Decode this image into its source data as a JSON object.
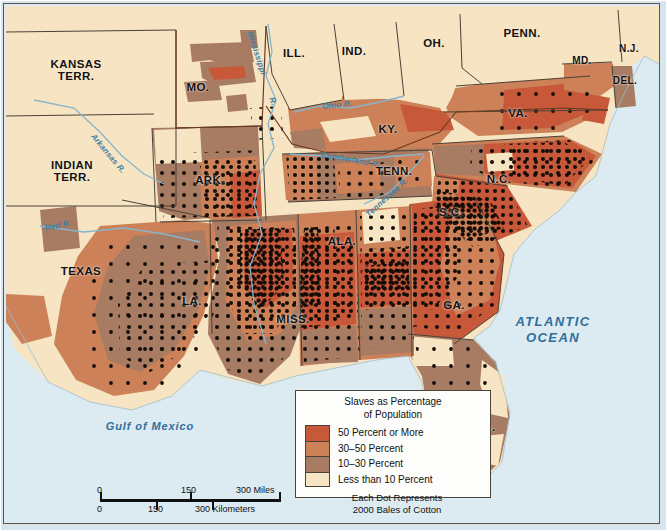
{
  "map": {
    "title_visible": false,
    "states": [
      {
        "name": "KANSAS TERR.",
        "label": "KANSAS\nTERR.",
        "x": 60,
        "y": 62,
        "size": "lg"
      },
      {
        "name": "INDIAN TERR.",
        "label": "INDIAN\nTERR.",
        "x": 56,
        "y": 163,
        "size": "lg"
      },
      {
        "name": "MO.",
        "label": "MO.",
        "x": 193,
        "y": 84,
        "size": "lg"
      },
      {
        "name": "ILL.",
        "label": "ILL.",
        "x": 289,
        "y": 50,
        "size": "lg"
      },
      {
        "name": "IND.",
        "label": "IND.",
        "x": 349,
        "y": 48,
        "size": "lg"
      },
      {
        "name": "OH.",
        "label": "OH.",
        "x": 429,
        "y": 40,
        "size": "lg"
      },
      {
        "name": "PENN.",
        "label": "PENN.",
        "x": 517,
        "y": 30,
        "size": "lg"
      },
      {
        "name": "N.J.",
        "label": "N.J.",
        "x": 625,
        "y": 46,
        "size": "sm"
      },
      {
        "name": "MD.",
        "label": "MD.",
        "x": 577,
        "y": 58,
        "size": "sm"
      },
      {
        "name": "DEL.",
        "label": "DEL.",
        "x": 620,
        "y": 78,
        "size": "sm"
      },
      {
        "name": "VA.",
        "label": "VA.",
        "x": 514,
        "y": 110,
        "size": "lg"
      },
      {
        "name": "KY.",
        "label": "KY.",
        "x": 383,
        "y": 126,
        "size": "lg"
      },
      {
        "name": "TENN.",
        "label": "TENN.",
        "x": 389,
        "y": 168,
        "size": "lg"
      },
      {
        "name": "N.C.",
        "label": "N.C.",
        "x": 494,
        "y": 176,
        "size": "lg"
      },
      {
        "name": "S.C.",
        "label": "S.C.",
        "x": 446,
        "y": 209,
        "size": "lg"
      },
      {
        "name": "ARK.",
        "label": "ARK.",
        "x": 205,
        "y": 177,
        "size": "lg"
      },
      {
        "name": "TEXAS",
        "label": "TEXAS",
        "x": 76,
        "y": 268,
        "size": "lg"
      },
      {
        "name": "LA.",
        "label": "LA.",
        "x": 187,
        "y": 298,
        "size": "lg"
      },
      {
        "name": "MISS.",
        "label": "MISS.",
        "x": 288,
        "y": 316,
        "size": "lg"
      },
      {
        "name": "ALA.",
        "label": "ALA.",
        "x": 337,
        "y": 238,
        "size": "lg"
      },
      {
        "name": "GA.",
        "label": "GA.",
        "x": 449,
        "y": 302,
        "size": "lg"
      },
      {
        "name": "FLA.",
        "label": "FLA.",
        "x": 477,
        "y": 424,
        "size": "lg"
      }
    ],
    "rivers": [
      {
        "name": "Mississippi R.",
        "label": "Mississippi",
        "x": 264,
        "y": 30,
        "rot": 72
      },
      {
        "name": "Mississippi R. abbrev",
        "label": "R.",
        "x": 271,
        "y": 92,
        "rot": 72
      },
      {
        "name": "Arkansas R.",
        "label": "Arkansas R.",
        "x": 94,
        "y": 132,
        "rot": 50
      },
      {
        "name": "Red R.",
        "label": "Red R.",
        "x": 55,
        "y": 228,
        "rot": -12
      },
      {
        "name": "Ohio R.",
        "label": "Ohio R.",
        "x": 340,
        "y": 105,
        "rot": -6
      },
      {
        "name": "Cumberland R.",
        "label": "Cumberland R.",
        "x": 345,
        "y": 152,
        "rot": 10
      },
      {
        "name": "Tennessee R.",
        "label": "Tennessee R.",
        "x": 387,
        "y": 192,
        "rot": -42
      }
    ],
    "waters": [
      {
        "name": "Atlantic Ocean",
        "label": "ATLANTIC\nOCEAN",
        "x": 542,
        "y": 318,
        "kind": "ocean"
      },
      {
        "name": "Gulf of Mexico",
        "label": "Gulf of Mexico",
        "x": 143,
        "y": 423,
        "kind": "gulf"
      }
    ]
  },
  "legend": {
    "title_line1": "Slaves as Percentage",
    "title_line2": "of Population",
    "entries": [
      {
        "label": "50 Percent or More",
        "color": "#c8583a"
      },
      {
        "label": "30–50 Percent",
        "color": "#cd8158"
      },
      {
        "label": "10–30 Percent",
        "color": "#a87b63"
      },
      {
        "label": "Less than 10 Percent",
        "color": "#f6e4c2"
      }
    ],
    "note_line1": "Each Dot Represents",
    "note_line2": "2000 Bales of Cotton"
  },
  "scale": {
    "miles": {
      "ticks": [
        "0",
        "150",
        "300 Miles"
      ]
    },
    "kilometers": {
      "ticks": [
        "0",
        "150",
        "300 Kilometers"
      ]
    }
  },
  "colors": {
    "water": "#dceaf1",
    "land_light": "#f6e4c2",
    "tier_50plus": "#c8583a",
    "tier_30_50": "#cd8158",
    "tier_10_30": "#a87b63",
    "tier_under10": "#f6e4c2",
    "border": "#4a4338",
    "dot": "#120d08",
    "river": "#3d7fa6"
  }
}
